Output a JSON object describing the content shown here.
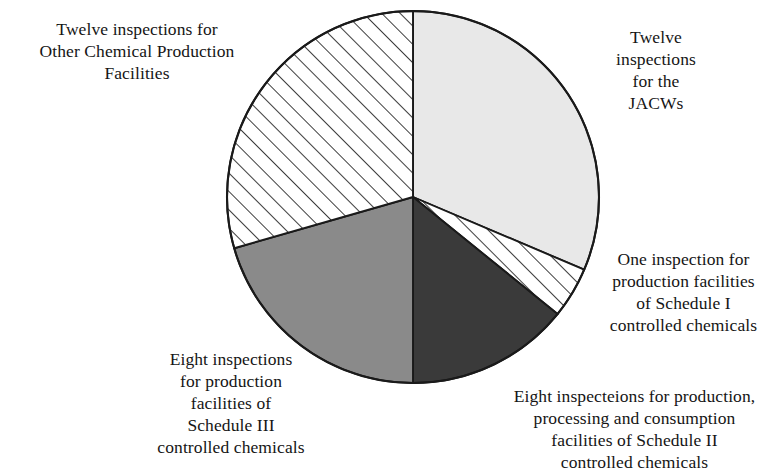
{
  "chart_data": {
    "type": "pie",
    "title": "",
    "subtitle": "",
    "xlabel": "",
    "ylabel": "",
    "legend_position": "none",
    "grid": false,
    "total_inspections": 41,
    "units": "inspections",
    "start_angle_deg": 0,
    "direction": "clockwise",
    "center": {
      "x": 413,
      "y": 197
    },
    "radius": 186,
    "categories": [
      "Twelve inspections for the JACWs",
      "One inspection for production facilities of Schedule I controlled chemicals",
      "Eight inspecteions for production, processing and consumption facilities of Schedule II controlled chemicals",
      "Eight inspections for production facilities of Schedule III controlled chemicals",
      "Twelve inspections for Other Chemical Production Facilities"
    ],
    "values": [
      12,
      1,
      8,
      8,
      12
    ],
    "slices": [
      {
        "key": "jacws",
        "label": "Twelve inspections for the JACWs",
        "value": 12,
        "start_deg": 0,
        "end_deg": 113,
        "fill": "#e8e8e8",
        "pattern": "solid",
        "stroke": "#1a1a1a"
      },
      {
        "key": "schedule_1",
        "label": "One inspection for production facilities of Schedule I controlled chemicals",
        "value": 1,
        "start_deg": 113,
        "end_deg": 129,
        "fill": "#ffffff",
        "pattern": "diagonal-hatch",
        "stroke": "#1a1a1a"
      },
      {
        "key": "schedule_2",
        "label": "Eight inspecteions for production, processing and consumption facilities of Schedule II controlled chemicals",
        "value": 8,
        "start_deg": 129,
        "end_deg": 180,
        "fill": "#3a3a3a",
        "pattern": "solid",
        "stroke": "#1a1a1a"
      },
      {
        "key": "schedule_3",
        "label": "Eight inspections for production facilities of Schedule III controlled chemicals",
        "value": 8,
        "start_deg": 180,
        "end_deg": 254,
        "fill": "#8a8a8a",
        "pattern": "solid",
        "stroke": "#1a1a1a"
      },
      {
        "key": "other",
        "label": "Twelve inspections for Other Chemical Production Facilities",
        "value": 12,
        "start_deg": 254,
        "end_deg": 360,
        "fill": "#ffffff",
        "pattern": "diagonal-hatch",
        "stroke": "#1a1a1a"
      }
    ]
  },
  "labels": {
    "other": "Twelve inspections for\nOther Chemical Production\nFacilities",
    "jacws": "Twelve\ninspections\nfor the\nJACWs",
    "schedule_1": "One inspection for\nproduction facilities\nof Schedule I\ncontrolled chemicals",
    "schedule_2": "Eight inspecteions for production,\nprocessing and consumption\nfacilities of Schedule II\ncontrolled chemicals",
    "schedule_3": "Eight inspections\nfor production\nfacilities of\nSchedule III\ncontrolled chemicals"
  },
  "colors": {
    "jacws_fill": "#e8e8e8",
    "schedule_1_fill": "#ffffff",
    "schedule_2_fill": "#3a3a3a",
    "schedule_3_fill": "#8a8a8a",
    "other_fill": "#ffffff",
    "outline": "#1a1a1a",
    "text": "#151515",
    "background": "#ffffff"
  }
}
